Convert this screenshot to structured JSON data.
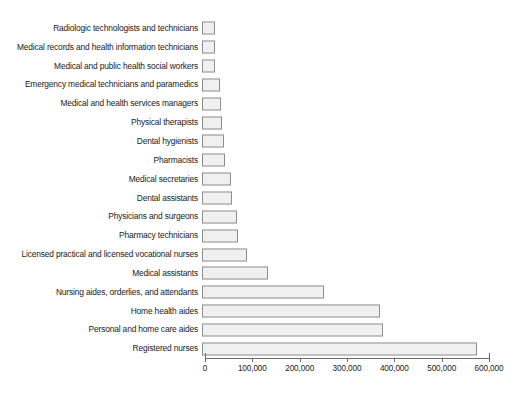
{
  "chart_data": {
    "type": "bar",
    "orientation": "horizontal",
    "title": "",
    "subtitle": "",
    "xlabel": "",
    "ylabel": "",
    "xlim": [
      0,
      600000
    ],
    "grid": false,
    "legend": null,
    "xticks": [
      {
        "value": 0,
        "label": "0"
      },
      {
        "value": 100000,
        "label": "100,000"
      },
      {
        "value": 200000,
        "label": "200,000"
      },
      {
        "value": 300000,
        "label": "300,000"
      },
      {
        "value": 400000,
        "label": "400,000"
      },
      {
        "value": 500000,
        "label": "500,000"
      },
      {
        "value": 600000,
        "label": "600,000"
      }
    ],
    "categories": [
      "Radiologic technologists and technicians",
      "Medical records and health information technicians",
      "Medical and public health social workers",
      "Emergency medical technicians and paramedics",
      "Medical and health services managers",
      "Physical therapists",
      "Dental hygienists",
      "Pharmacists",
      "Medical secretaries",
      "Dental assistants",
      "Physicians and surgeons",
      "Pharmacy technicians",
      "Licensed practical and licensed vocational nurses",
      "Medical assistants",
      "Nursing aides, orderlies, and attendants",
      "Home health aides",
      "Personal and home care aides",
      "Registered nurses"
    ],
    "values": [
      28000,
      28000,
      28000,
      38000,
      41000,
      43000,
      46000,
      49000,
      61000,
      63000,
      74000,
      75000,
      96000,
      140000,
      258000,
      376000,
      382000,
      582000
    ],
    "bar_style": {
      "fill": "#f0f0f0",
      "border": "#8e8e8e"
    }
  },
  "axis": {
    "line_color": "#6b6b6b"
  }
}
